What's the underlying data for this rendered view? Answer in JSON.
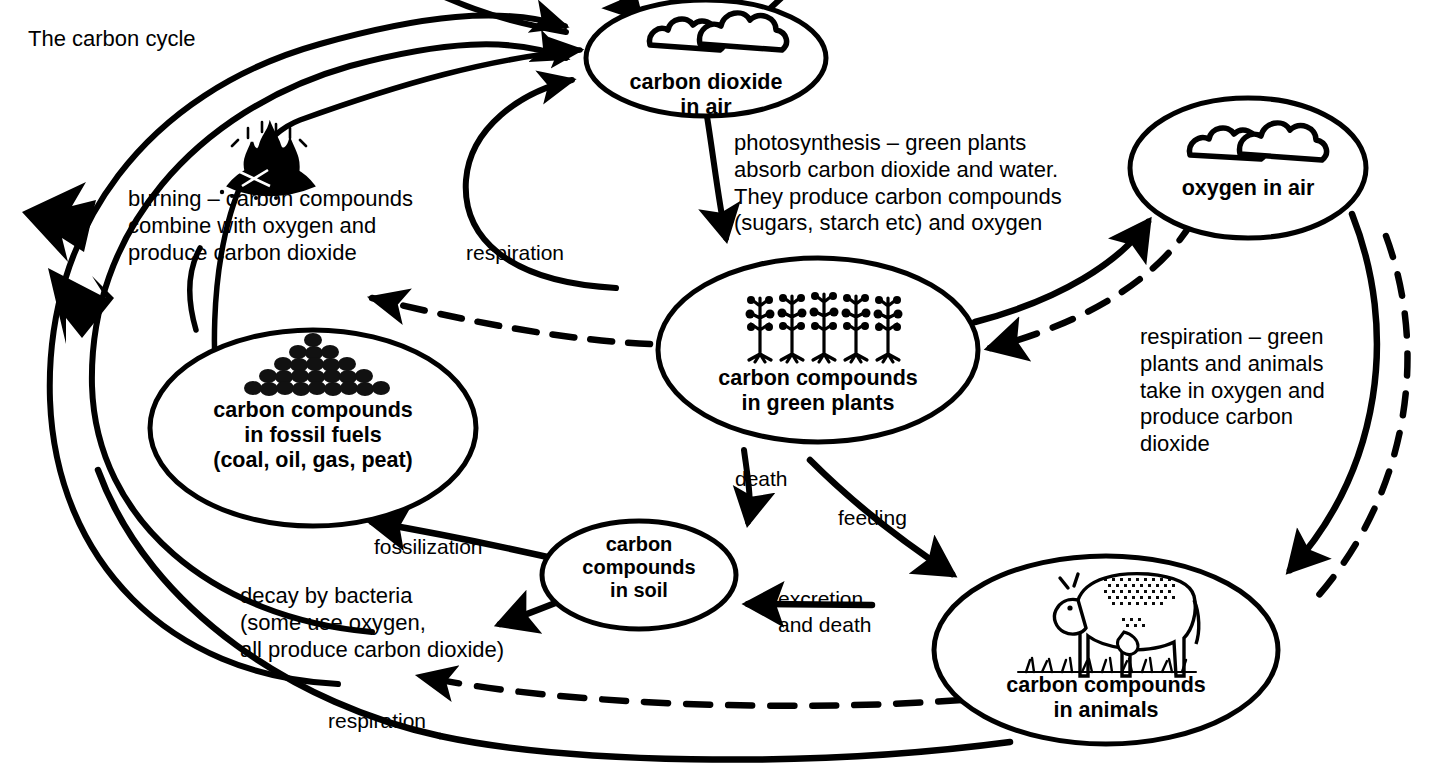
{
  "title": "The carbon cycle",
  "nodes": [
    {
      "id": "co2",
      "label": "carbon dioxide\nin air",
      "icon": "clouds-icon"
    },
    {
      "id": "oxygen",
      "label": "oxygen in air",
      "icon": "clouds-icon"
    },
    {
      "id": "plants",
      "label": "carbon compounds\nin green plants",
      "icon": "plants-icon"
    },
    {
      "id": "fossil",
      "label": "carbon compounds\nin fossil fuels\n(coal, oil, gas, peat)",
      "icon": "coal-pile-icon"
    },
    {
      "id": "soil",
      "label": "carbon\ncompounds\nin soil",
      "icon": "none"
    },
    {
      "id": "animals",
      "label": "carbon compounds\nin animals",
      "icon": "cow-icon"
    }
  ],
  "descriptions": [
    {
      "id": "burning",
      "text": "burning – carbon compounds\ncombine with oxygen and\nproduce carbon dioxide"
    },
    {
      "id": "photosynthesis",
      "text": "photosynthesis – green plants\nabsorb carbon dioxide and water.\nThey produce carbon compounds\n(sugars, starch etc) and oxygen"
    },
    {
      "id": "respiration-right",
      "text": "respiration – green\nplants and animals\ntake in oxygen and\nproduce carbon\ndioxide"
    },
    {
      "id": "decay",
      "text": "decay by bacteria\n(some use oxygen,\nall produce carbon dioxide)"
    }
  ],
  "arrow_labels": [
    {
      "id": "respiration-plants",
      "text": "respiration"
    },
    {
      "id": "death",
      "text": "death"
    },
    {
      "id": "feeding",
      "text": "feeding"
    },
    {
      "id": "fossilization",
      "text": "fossilization"
    },
    {
      "id": "excretion",
      "text": "excretion\nand death"
    },
    {
      "id": "respiration-bottom",
      "text": "respiration"
    }
  ],
  "style": {
    "ink": "#000000",
    "paper": "#ffffff"
  }
}
